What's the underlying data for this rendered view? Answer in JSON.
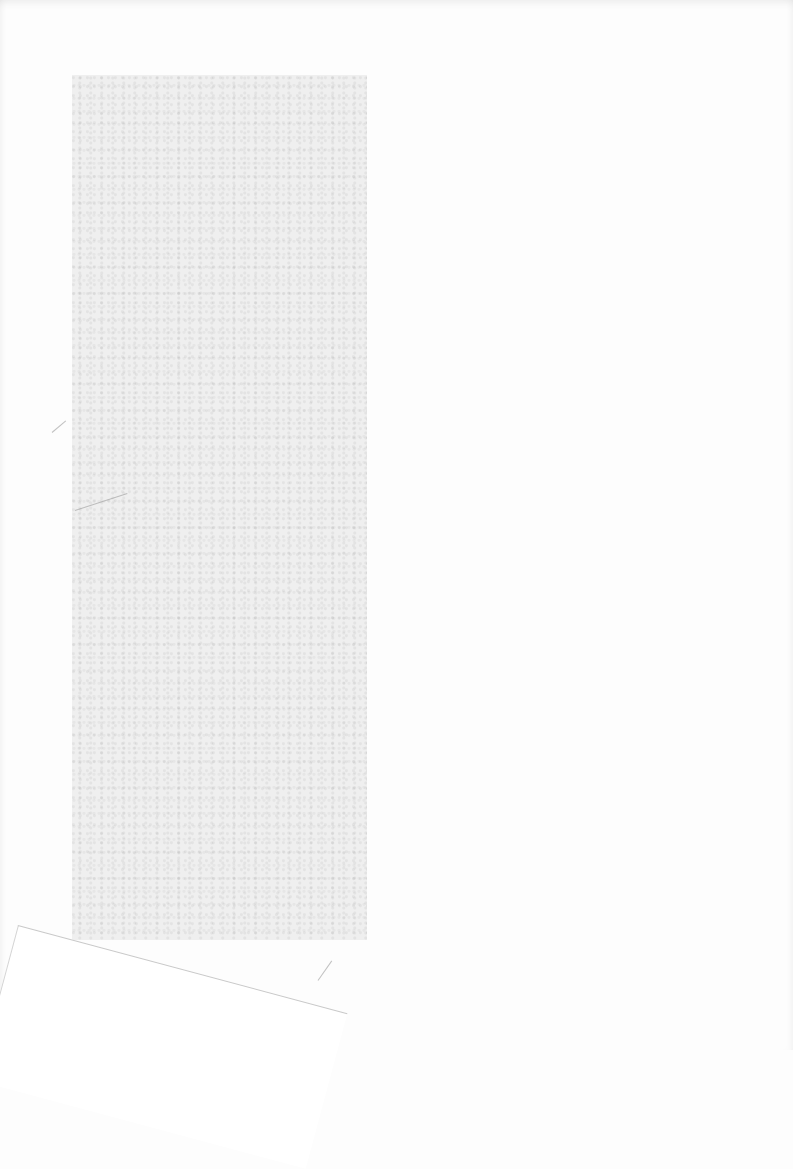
{
  "page": {
    "background_color": "#fdfdfd",
    "block_color": "#efefef",
    "text": ""
  }
}
